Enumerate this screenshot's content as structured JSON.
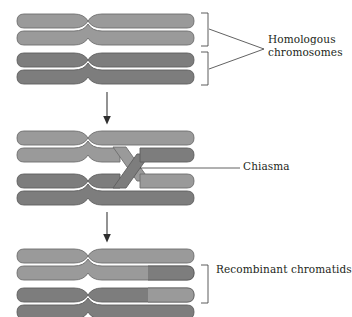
{
  "figure": {
    "background_color": "#ffffff"
  },
  "colors": {
    "chromatid_light": "#9a9a9a",
    "chromatid_dark": "#7d7d7d",
    "outline": "#6a6a6a",
    "line": "#3a3a3a",
    "text": "#231f20"
  },
  "labels": {
    "homologous_line1": "Homologous",
    "homologous_line2": "chromosomes",
    "chiasma": "Chiasma",
    "recombinant": "Recombinant chromatids"
  },
  "panels": [
    {
      "id": "panel-top",
      "stage": "paired homologous chromosomes",
      "chromatids": [
        {
          "index": 1,
          "shade": "light"
        },
        {
          "index": 2,
          "shade": "light"
        },
        {
          "index": 3,
          "shade": "dark"
        },
        {
          "index": 4,
          "shade": "dark"
        }
      ],
      "bracket_count": 2,
      "label": "Homologous chromosomes"
    },
    {
      "id": "panel-middle",
      "stage": "chiasma formation / crossing over",
      "chromatids": [
        {
          "index": 1,
          "shade": "light"
        },
        {
          "index": 2,
          "shade": "light",
          "crosses": true
        },
        {
          "index": 3,
          "shade": "dark",
          "crosses": true
        },
        {
          "index": 4,
          "shade": "dark"
        }
      ],
      "bracket_count": 0,
      "label": "Chiasma"
    },
    {
      "id": "panel-bottom",
      "stage": "recombinant chromatids after crossover",
      "chromatids": [
        {
          "index": 1,
          "shade": "light"
        },
        {
          "index": 2,
          "shade": "light",
          "right_segment_shade": "dark",
          "recombinant": true
        },
        {
          "index": 3,
          "shade": "dark",
          "right_segment_shade": "light",
          "recombinant": true
        },
        {
          "index": 4,
          "shade": "dark"
        }
      ],
      "bracket_count": 1,
      "label": "Recombinant chromatids"
    }
  ],
  "arrows": [
    {
      "id": "arrow-top-to-middle",
      "direction": "down"
    },
    {
      "id": "arrow-middle-to-bottom",
      "direction": "down"
    }
  ]
}
